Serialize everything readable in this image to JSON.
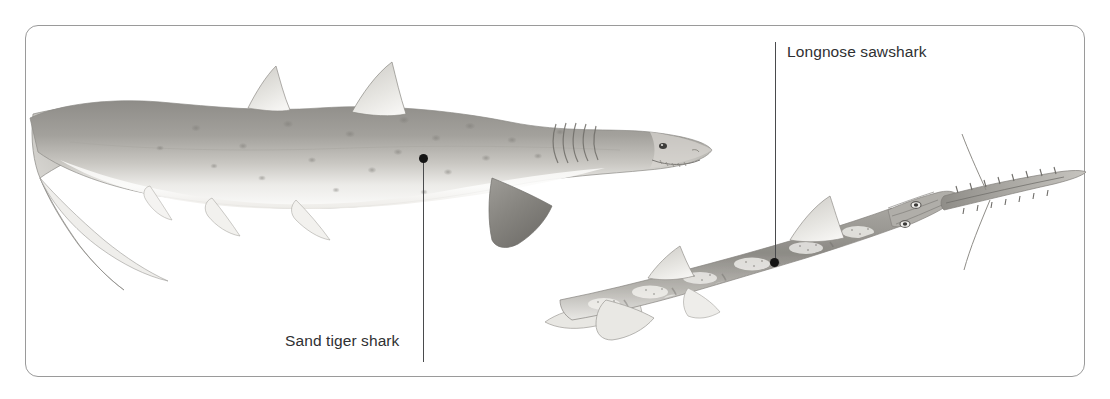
{
  "plate": {
    "background_color": "#ffffff",
    "border_color": "#9a9a9a",
    "border_radius_px": 13,
    "width_px": 1110,
    "height_px": 399
  },
  "callouts": [
    {
      "id": "sand-tiger-shark",
      "label": "Sand tiger shark",
      "text_color": "#2f3032",
      "font_size_px": 15.5,
      "label_x": 285,
      "label_y": 333,
      "leader_x": 423,
      "leader_top_y": 160,
      "leader_bottom_y": 362,
      "dot_x": 423,
      "dot_y": 158
    },
    {
      "id": "longnose-sawshark",
      "label": "Longnose sawshark",
      "text_color": "#2f3032",
      "font_size_px": 15.5,
      "label_x": 787,
      "label_y": 44,
      "leader_x": 775,
      "leader_top_y": 42,
      "leader_bottom_y": 264,
      "dot_x": 775,
      "dot_y": 263
    }
  ],
  "illustrations": [
    {
      "id": "sand-tiger-shark-illustration",
      "species": "Sand tiger shark",
      "style": "grayscale pencil / airbrush scientific illustration",
      "orientation": "facing right",
      "bounds": {
        "x": 28,
        "y": 60,
        "width": 690,
        "height": 250
      },
      "features": [
        "pointed conical snout with protruding ragged teeth",
        "five gill slits",
        "two similarly sized dorsal fins set far back",
        "large dark triangular pectoral fin",
        "pelvic and anal fins along the belly",
        "asymmetrical heterocercal caudal fin with long upper lobe",
        "brown-gray dorsal surface with scattered darker spots",
        "pale cream countershaded underside"
      ]
    },
    {
      "id": "longnose-sawshark-illustration",
      "species": "Longnose sawshark",
      "style": "grayscale pencil / airbrush scientific illustration",
      "orientation": "facing upper right",
      "bounds": {
        "x": 540,
        "y": 170,
        "width": 550,
        "height": 160
      },
      "features": [
        "very long flattened toothed rostrum (saw) with alternating lateral teeth",
        "pair of long barbels midway along the rostrum",
        "slender elongated body angled diagonally",
        "two dorsal fins and broad pectoral fins",
        "mottled pale blotches and dark bands along the body",
        "no anal fin, low tapering caudal fin"
      ]
    }
  ]
}
